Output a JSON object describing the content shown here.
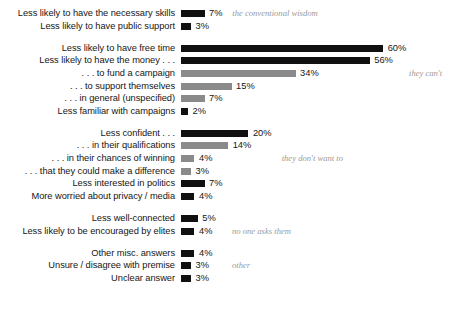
{
  "chart_data": {
    "type": "bar",
    "orientation": "horizontal",
    "title": "",
    "xlabel": "",
    "ylabel": "",
    "xlim": [
      0,
      60
    ],
    "grid": false,
    "legend": false,
    "value_suffix": "%",
    "bar_colors": {
      "primary": "#101010",
      "secondary": "#8a8a8a"
    },
    "annotation_color": "#9a9a9a",
    "groups": [
      {
        "note": "the conventional wisdom",
        "note_row": 0,
        "rows": [
          {
            "label": "Less likely to have the necessary skills",
            "value": 7,
            "value_label": "7%",
            "color": "primary"
          },
          {
            "label": "Less likely to have public support",
            "value": 3,
            "value_label": "3%",
            "color": "primary"
          }
        ]
      },
      {
        "note": "they can't",
        "note_row": 2,
        "rows": [
          {
            "label": "Less likely to have free time",
            "value": 60,
            "value_label": "60%",
            "color": "primary"
          },
          {
            "label": "Less likely to have the money . . .",
            "value": 56,
            "value_label": "56%",
            "color": "primary"
          },
          {
            "label": ". . . to fund a campaign",
            "value": 34,
            "value_label": "34%",
            "color": "secondary"
          },
          {
            "label": ". . . to support themselves",
            "value": 15,
            "value_label": "15%",
            "color": "secondary"
          },
          {
            "label": ". . . in general (unspecified)",
            "value": 7,
            "value_label": "7%",
            "color": "secondary"
          },
          {
            "label": "Less familiar with campaigns",
            "value": 2,
            "value_label": "2%",
            "color": "primary"
          }
        ]
      },
      {
        "note": "they don't want to",
        "note_row": 2,
        "rows": [
          {
            "label": "Less confident . . .",
            "value": 20,
            "value_label": "20%",
            "color": "primary"
          },
          {
            "label": ". . . in their qualifications",
            "value": 14,
            "value_label": "14%",
            "color": "secondary"
          },
          {
            "label": ". . . in their chances of winning",
            "value": 4,
            "value_label": "4%",
            "color": "secondary"
          },
          {
            "label": ". . . that they could make a difference",
            "value": 3,
            "value_label": "3%",
            "color": "secondary"
          },
          {
            "label": "Less interested in politics",
            "value": 7,
            "value_label": "7%",
            "color": "primary"
          },
          {
            "label": "More worried about privacy / media",
            "value": 4,
            "value_label": "4%",
            "color": "primary"
          }
        ]
      },
      {
        "note": "no one asks them",
        "note_row": 1,
        "rows": [
          {
            "label": "Less well-connected",
            "value": 5,
            "value_label": "5%",
            "color": "primary"
          },
          {
            "label": "Less likely to be encouraged by elites",
            "value": 4,
            "value_label": "4%",
            "color": "primary"
          }
        ]
      },
      {
        "note": "other",
        "note_row": 1,
        "rows": [
          {
            "label": "Other misc. answers",
            "value": 4,
            "value_label": "4%",
            "color": "primary"
          },
          {
            "label": "Unsure / disagree with premise",
            "value": 3,
            "value_label": "3%",
            "color": "primary"
          },
          {
            "label": "Unclear answer",
            "value": 3,
            "value_label": "3%",
            "color": "primary"
          }
        ]
      }
    ]
  }
}
